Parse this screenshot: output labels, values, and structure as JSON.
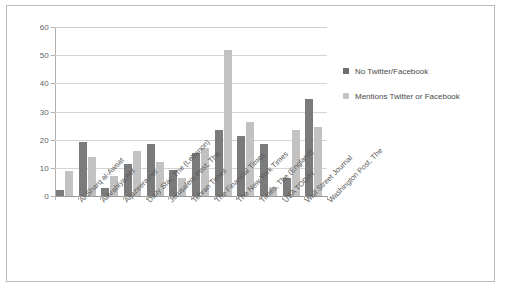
{
  "chart_data": {
    "type": "bar",
    "title": "",
    "xlabel": "",
    "ylabel": "",
    "ylim": [
      0,
      60
    ],
    "yticks": [
      0,
      10,
      20,
      30,
      40,
      50,
      60
    ],
    "grid": true,
    "legend_position": "right",
    "categories": [
      "Al-Sharq al-Awsat",
      "AlArabiya.net",
      "Aljazeera.net",
      "Daily Star, The (Lebanon)",
      "Jerusalem Post, The",
      "Tehran Times",
      "The Financial Times",
      "The New York Times",
      "Times, The (England)",
      "USA TODAY",
      "Wall Street Journal",
      "Washington Post, The"
    ],
    "series": [
      {
        "name": "No Twitter/Facebook",
        "color": "#7b7b7b",
        "values": [
          2,
          19.2,
          3,
          11.2,
          18.3,
          9.3,
          15.2,
          23.3,
          21.3,
          18.4,
          6.5,
          34.5
        ]
      },
      {
        "name": "Mentions Twitter or Facebook",
        "color": "#c2c2c2",
        "values": [
          9,
          14,
          7.2,
          16,
          12.2,
          6.4,
          17,
          52,
          26.3,
          3.3,
          23.3,
          24.4
        ]
      }
    ]
  },
  "legend": {
    "items": [
      {
        "label": "No Twitter/Facebook",
        "swatch": "dark"
      },
      {
        "label": "Mentions Twitter or Facebook",
        "swatch": "light"
      }
    ]
  },
  "axis": {
    "y_tick_labels": [
      "60",
      "50",
      "40",
      "30",
      "20",
      "10",
      "0"
    ]
  },
  "colors": {
    "series_dark": "#7b7b7b",
    "series_light": "#c2c2c2",
    "grid": "#d4d4d4",
    "frame_border": "#b9b9b9",
    "text": "#585858",
    "background": "#ffffff"
  }
}
